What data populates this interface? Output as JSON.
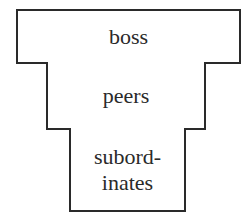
{
  "diagram": {
    "type": "stacked-hierarchy",
    "levels": [
      {
        "label": "boss"
      },
      {
        "label": "peers"
      },
      {
        "label": "subord-\ninates"
      }
    ],
    "colors": {
      "stroke": "#2a2a2a",
      "fill": "#ffffff",
      "text": "#2a2a2a"
    }
  }
}
